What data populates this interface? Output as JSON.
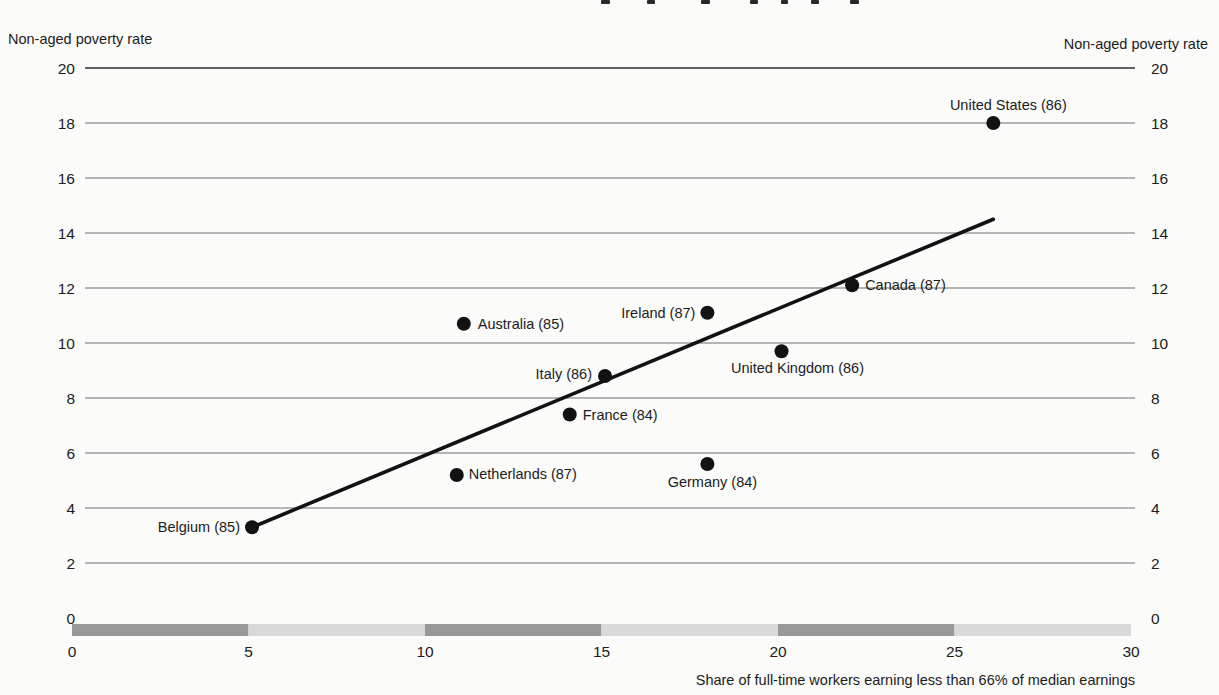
{
  "axes": {
    "left_axis_title": "Non-aged poverty rate",
    "right_axis_title": "Non-aged poverty rate",
    "x_axis_title": "Share of full-time workers earning less than 66% of median earnings"
  },
  "chart_data": {
    "type": "scatter",
    "title": "",
    "xlabel": "Share of full-time workers earning less than 66% of median earnings",
    "ylabel": "Non-aged poverty rate",
    "ylabel_right": "Non-aged poverty rate",
    "xlim": [
      0,
      30
    ],
    "ylim": [
      0,
      20
    ],
    "x_ticks": [
      0,
      5,
      10,
      15,
      20,
      25,
      30
    ],
    "y_ticks": [
      0,
      2,
      4,
      6,
      8,
      10,
      12,
      14,
      16,
      18,
      20
    ],
    "grid": "horizontal-only",
    "legend": "none",
    "points": [
      {
        "label": "United States (86)",
        "x": 26.1,
        "y": 18.0,
        "anchor": "middle",
        "dx": 15,
        "dy": -13
      },
      {
        "label": "Canada (87)",
        "x": 22.1,
        "y": 12.1,
        "anchor": "start",
        "dx": 13,
        "dy": 5
      },
      {
        "label": "Ireland (87)",
        "x": 18.0,
        "y": 11.1,
        "anchor": "end",
        "dx": -12,
        "dy": 5
      },
      {
        "label": "United Kingdom (86)",
        "x": 20.1,
        "y": 9.7,
        "anchor": "middle",
        "dx": 16,
        "dy": 22
      },
      {
        "label": "Australia (85)",
        "x": 11.1,
        "y": 10.7,
        "anchor": "start",
        "dx": 14,
        "dy": 5
      },
      {
        "label": "Italy (86)",
        "x": 15.1,
        "y": 8.8,
        "anchor": "end",
        "dx": -13,
        "dy": 3
      },
      {
        "label": "France (84)",
        "x": 14.1,
        "y": 7.4,
        "anchor": "start",
        "dx": 13,
        "dy": 5
      },
      {
        "label": "Netherlands (87)",
        "x": 10.9,
        "y": 5.2,
        "anchor": "start",
        "dx": 12,
        "dy": 4
      },
      {
        "label": "Germany (84)",
        "x": 18.0,
        "y": 5.6,
        "anchor": "middle",
        "dx": 5,
        "dy": 23
      },
      {
        "label": "Belgium (85)",
        "x": 5.1,
        "y": 3.3,
        "anchor": "end",
        "dx": -12,
        "dy": 5
      }
    ],
    "trend_line": {
      "x1": 5.1,
      "y1": 3.3,
      "x2": 26.1,
      "y2": 14.5
    },
    "axis_bar_segments": [
      {
        "from": 0,
        "to": 5,
        "shade": "dark"
      },
      {
        "from": 5,
        "to": 10,
        "shade": "light"
      },
      {
        "from": 10,
        "to": 15,
        "shade": "dark"
      },
      {
        "from": 15,
        "to": 20,
        "shade": "light"
      },
      {
        "from": 20,
        "to": 25,
        "shade": "dark"
      },
      {
        "from": 25,
        "to": 30,
        "shade": "light"
      }
    ]
  },
  "colors": {
    "text": "#1c1c1c",
    "gridline": "#6f6f6f",
    "top_gridline": "#2e2e2e",
    "dot": "#121212",
    "trend_line": "#121212",
    "bar_dark": "#989898",
    "bar_light": "#d9d9d9",
    "background": "#fbfbfa"
  }
}
